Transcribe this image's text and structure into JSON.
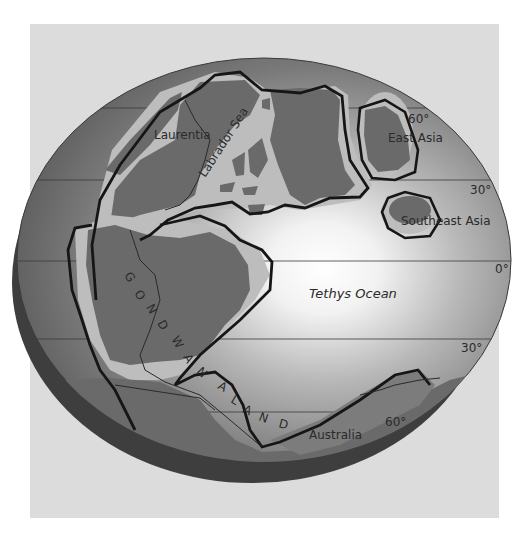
{
  "map": {
    "title": "Paleogeographic globe",
    "colors": {
      "panel_bg": "#dcdcdc",
      "ocean_dark": "#6f6f6f",
      "ocean_glow": "#ffffff",
      "globe_shadow": "#3e3e3e",
      "continent_land": "#6a6a6a",
      "continental_shelf": "#bdbdbd",
      "outline": "#161616",
      "grid_line": "#3a3a3a"
    },
    "labels": {
      "laurentia": "Laurentia",
      "labrador_sea": "Labrador Sea",
      "east_asia": "East Asia",
      "southeast_asia": "Southeast Asia",
      "tethys_ocean": "Tethys Ocean",
      "australia": "Australia",
      "gondwanaland_letters": [
        "G",
        "O",
        "N",
        "D",
        "W",
        "A",
        "N",
        "A",
        "L",
        "A",
        "N",
        "D"
      ]
    },
    "latitudes": [
      {
        "label": "60°",
        "hemisphere": "N",
        "y": 108
      },
      {
        "label": "30°",
        "hemisphere": "N",
        "y": 180
      },
      {
        "label": "0°",
        "hemisphere": "",
        "y": 261
      },
      {
        "label": "30°",
        "hemisphere": "S",
        "y": 339
      },
      {
        "label": "60°",
        "hemisphere": "S",
        "y": 412
      }
    ]
  }
}
